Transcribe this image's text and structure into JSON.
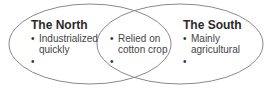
{
  "diagram": {
    "type": "venn",
    "left": {
      "title": "The North",
      "items": [
        "Industrialized",
        "quickly"
      ]
    },
    "overlap": {
      "items": [
        "Relied on",
        "cotton crop"
      ]
    },
    "right": {
      "title": "The South",
      "items": [
        "Mainly",
        "agricultural"
      ]
    },
    "bullet_glyph": "•",
    "stroke_color": "#8a8a8a"
  }
}
